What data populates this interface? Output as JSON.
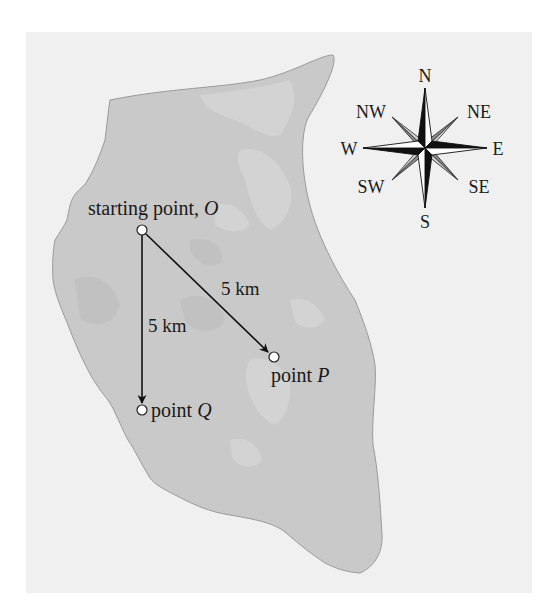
{
  "figure": {
    "background_color": "#f0f0f0",
    "island_fill": "#c9c9c9",
    "island_patch": "#d6d6d6",
    "island_outline": "#9a9a9a"
  },
  "points": {
    "origin": {
      "label": "starting point, ",
      "letter": "O",
      "x": 142,
      "y": 230
    },
    "p": {
      "label": "point ",
      "letter": "P",
      "x": 274,
      "y": 357
    },
    "q": {
      "label": "point ",
      "letter": "Q",
      "x": 142,
      "y": 410
    }
  },
  "distances": {
    "op": "5 km",
    "oq": "5 km"
  },
  "compass": {
    "center": {
      "x": 425,
      "y": 148
    },
    "labels": {
      "n": "N",
      "ne": "NE",
      "e": "E",
      "se": "SE",
      "s": "S",
      "sw": "SW",
      "w": "W",
      "nw": "NW"
    }
  }
}
